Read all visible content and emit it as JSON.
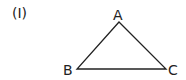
{
  "figure": {
    "label": "(I)",
    "vertices": {
      "A": {
        "label": "A"
      },
      "B": {
        "label": "B"
      },
      "C": {
        "label": "C"
      }
    },
    "stroke_color": "#222222"
  }
}
